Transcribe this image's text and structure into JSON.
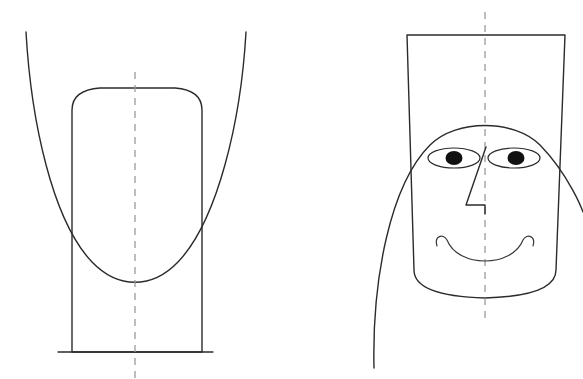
{
  "canvas": {
    "width": 583,
    "height": 379,
    "background_color": "#ffffff",
    "stroke_color": "#2b2b2b",
    "axis_color": "#9a9a9a",
    "pupil_color": "#111111"
  },
  "figures": [
    {
      "id": "left-figure",
      "name": "inverted-abstract-figure",
      "description": "Inverted construction: downward-opening wide parabolic arc with an upright tapered body having a rounded top",
      "parts": [
        {
          "name": "outer-parabolic-arc",
          "type": "open-curve",
          "path": "M 26 32 C 31 120, 52 220, 92 262 C 118 289, 152 289, 178 262 C 218 220, 241 120, 246 32"
        },
        {
          "name": "body-outline",
          "type": "closed-tapered-shape",
          "path": "M 72 352 L 72 110 Q 72 90, 100 88 L 175 88 Q 202 90, 202 110 L 202 352 Z",
          "note": "rendered as flared trapezoid with rounded upper corners"
        },
        {
          "name": "body-base-line",
          "type": "line",
          "path": "M 58 352 L 213 352"
        }
      ],
      "axis": {
        "name": "vertical-symmetry-axis",
        "x": 135,
        "y_start": 72,
        "y_end": 379,
        "style": "dashed"
      }
    },
    {
      "id": "right-figure",
      "name": "face-figure",
      "description": "Same construction read as a face: trapezoid head, dome hairline arc, two eyes, zigzag nose, smile",
      "parts": [
        {
          "name": "head-trapezoid",
          "type": "closed-tapered-shape",
          "path": "M 407 35 L 565 35 L 556 270 Q 556 296, 485 298 Q 414 296, 414 270 Z"
        },
        {
          "name": "dome-hairline-arc",
          "type": "open-curve",
          "path": "M 374 368 C 372 280, 390 185, 430 145 C 456 119, 514 119, 540 145 C 570 176, 583 212, 583 212"
        },
        {
          "name": "left-eye",
          "type": "ellipse",
          "cx": 454,
          "cy": 158,
          "rx": 26,
          "ry": 10
        },
        {
          "name": "left-pupil",
          "type": "ellipse",
          "cx": 454,
          "cy": 158,
          "rx": 8.5,
          "ry": 7
        },
        {
          "name": "right-eye",
          "type": "ellipse",
          "cx": 514,
          "cy": 158,
          "rx": 26,
          "ry": 10
        },
        {
          "name": "right-pupil",
          "type": "ellipse",
          "cx": 516,
          "cy": 158,
          "rx": 8.5,
          "ry": 7
        },
        {
          "name": "nose",
          "type": "polyline",
          "path": "M 486 147 L 466 205 L 485 205 L 485 214"
        },
        {
          "name": "mouth-smile",
          "type": "open-curve",
          "path": "M 437 246 C 434 236, 443 233, 447 240 C 458 268, 512 268, 523 240 C 527 233, 536 236, 533 246"
        }
      ],
      "axis": {
        "name": "vertical-symmetry-axis",
        "x": 485,
        "y_start": 12,
        "y_end": 320,
        "style": "dashed"
      }
    }
  ]
}
